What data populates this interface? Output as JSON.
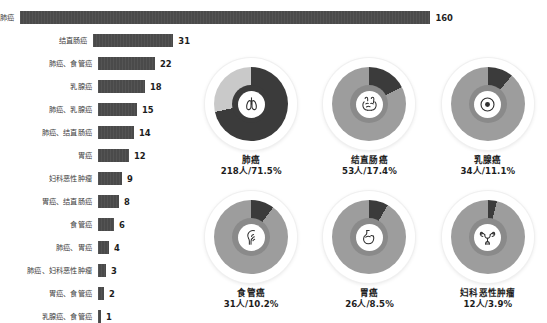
{
  "chart_data": [
    {
      "type": "bar",
      "title": "",
      "xlabel": "",
      "ylabel": "",
      "orientation": "horizontal",
      "grid": false,
      "legend": "none",
      "xlim": [
        0,
        160
      ],
      "categories": [
        "肺癌",
        "结直肠癌",
        "肺癌、食管癌",
        "乳腺癌",
        "肺癌、乳腺癌",
        "肺癌、结直肠癌",
        "胃癌",
        "妇科恶性肿瘤",
        "胃癌、结直肠癌",
        "食管癌",
        "肺癌、胃癌",
        "肺癌、妇科恶性肿瘤",
        "胃癌、食管癌",
        "乳腺癌、食管癌"
      ],
      "values": [
        160,
        31,
        22,
        18,
        15,
        14,
        12,
        9,
        8,
        6,
        4,
        3,
        2,
        1
      ],
      "bar_color": "#4a4a4a"
    },
    {
      "type": "pie",
      "title": "",
      "legend": "none",
      "labels": [
        "肺癌",
        "结直肠癌",
        "乳腺癌",
        "食管癌",
        "胃癌",
        "妇科恶性肿瘤"
      ],
      "values": [
        71.5,
        17.4,
        11.1,
        10.2,
        8.5,
        3.9
      ],
      "counts": [
        218,
        53,
        34,
        31,
        26,
        12
      ],
      "value_color": "#3a3a3a",
      "remainder_color": "#c9c9c9"
    }
  ],
  "bar_chart": {
    "rows": [
      {
        "label": "肺癌",
        "value": "160",
        "width": 410
      },
      {
        "label": "结直肠癌",
        "value": "31",
        "width": 80
      },
      {
        "label": "肺癌、食管癌",
        "value": "22",
        "width": 57
      },
      {
        "label": "乳腺癌",
        "value": "18",
        "width": 47
      },
      {
        "label": "肺癌、乳腺癌",
        "value": "15",
        "width": 39
      },
      {
        "label": "肺癌、结直肠癌",
        "value": "14",
        "width": 36
      },
      {
        "label": "胃癌",
        "value": "12",
        "width": 31
      },
      {
        "label": "妇科恶性肿瘤",
        "value": "9",
        "width": 24
      },
      {
        "label": "胃癌、结直肠癌",
        "value": "8",
        "width": 21
      },
      {
        "label": "食管癌",
        "value": "6",
        "width": 16
      },
      {
        "label": "肺癌、胃癌",
        "value": "4",
        "width": 11
      },
      {
        "label": "肺癌、妇科恶性肿瘤",
        "value": "3",
        "width": 8
      },
      {
        "label": "胃癌、食管癌",
        "value": "2",
        "width": 6
      },
      {
        "label": "乳腺癌、食管癌",
        "value": "1",
        "width": 3
      }
    ]
  },
  "donuts": [
    {
      "name": "肺癌",
      "stat": "218人/71.5%",
      "percent": 71.5,
      "icon": "lungs-icon",
      "value_color": "#3b3b3b",
      "remainder_color": "#c9c9c9",
      "hole_color": "#3b3b3b"
    },
    {
      "name": "结直肠癌",
      "stat": "53人/17.4%",
      "percent": 17.4,
      "icon": "intestine-icon",
      "value_color": "#3b3b3b",
      "remainder_color": "#9d9d9d",
      "hole_color": "#8a8a8a"
    },
    {
      "name": "乳腺癌",
      "stat": "34人/11.1%",
      "percent": 11.1,
      "icon": "breast-icon",
      "value_color": "#3b3b3b",
      "remainder_color": "#9d9d9d",
      "hole_color": "#8a8a8a"
    },
    {
      "name": "食管癌",
      "stat": "31人/10.2%",
      "percent": 10.2,
      "icon": "esophagus-icon",
      "value_color": "#3b3b3b",
      "remainder_color": "#9d9d9d",
      "hole_color": "#8a8a8a"
    },
    {
      "name": "胃癌",
      "stat": "26人/8.5%",
      "percent": 8.5,
      "icon": "stomach-icon",
      "value_color": "#3b3b3b",
      "remainder_color": "#9d9d9d",
      "hole_color": "#8a8a8a"
    },
    {
      "name": "妇科恶性肿瘤",
      "stat": "12人/3.9%",
      "percent": 3.9,
      "icon": "uterus-icon",
      "value_color": "#3b3b3b",
      "remainder_color": "#9d9d9d",
      "hole_color": "#8a8a8a"
    }
  ]
}
